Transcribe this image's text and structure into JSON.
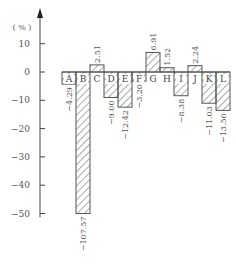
{
  "chart_data": {
    "type": "bar",
    "title": "",
    "xlabel": "",
    "ylabel": "(%)",
    "ylim": [
      -50,
      10
    ],
    "yticks": [
      10,
      0,
      -10,
      -20,
      -30,
      -40,
      -50
    ],
    "grid": false,
    "legend": null,
    "categories": [
      "A",
      "B",
      "C",
      "D",
      "E",
      "F",
      "G",
      "H",
      "I",
      "J",
      "K",
      "L"
    ],
    "values": [
      -4.29,
      -107.57,
      2.51,
      -9.0,
      -12.42,
      -3.2,
      6.91,
      1.52,
      -8.38,
      2.24,
      -11.03,
      -13.56
    ],
    "value_labels": [
      "-4.29",
      "-107.57",
      "2.51",
      "-9.00",
      "-12.42",
      "-3.20",
      "6.91",
      "1.52",
      "-8.38",
      "2.24",
      "-11.03",
      "-13.56"
    ]
  },
  "axis": {
    "unit": "( % )",
    "ticks": [
      "10",
      "0",
      "−10",
      "−20",
      "−30",
      "−40",
      "−50"
    ]
  }
}
